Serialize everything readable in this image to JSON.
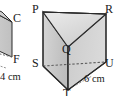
{
  "figure": {
    "background_color": "#ffffff",
    "outline_color": "#2b2b2b",
    "hidden_edge_color": "#6b6b6b",
    "face_fill_light": "#e3e3e3",
    "face_fill_mid": "#cfcfcf",
    "face_fill_dark": "#bdbdbd",
    "main_prism": {
      "vertices": {
        "P": "P",
        "Q": "Q",
        "R": "R",
        "S": "S",
        "T": "T",
        "U": "U"
      },
      "dimension_labels": [
        {
          "text": "6 cm",
          "edge": "T-U"
        }
      ]
    },
    "partial_figure_left": {
      "vertices": {
        "C": "C",
        "F": "F"
      },
      "dimension_labels": [
        {
          "text": "4 cm",
          "edge": "bottom"
        }
      ]
    }
  }
}
